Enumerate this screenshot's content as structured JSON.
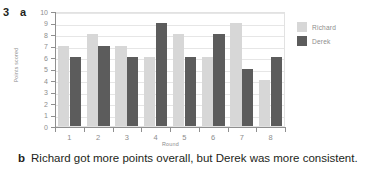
{
  "question": {
    "number": "3",
    "part_a_label": "a",
    "part_b_label": "b",
    "part_b_text": "Richard got more points overall, but Derek was more consistent."
  },
  "legend": {
    "items": [
      {
        "label": "Richard",
        "color": "#d7d7d7"
      },
      {
        "label": "Derek",
        "color": "#5c5c5c"
      }
    ]
  },
  "chart_data": {
    "type": "bar",
    "title": "",
    "xlabel": "Round",
    "ylabel": "Points scored",
    "categories": [
      "1",
      "2",
      "3",
      "4",
      "5",
      "6",
      "7",
      "8"
    ],
    "series": [
      {
        "name": "Richard",
        "color": "#d7d7d7",
        "values": [
          7,
          8,
          7,
          6,
          8,
          6,
          9,
          4
        ]
      },
      {
        "name": "Derek",
        "color": "#5c5c5c",
        "values": [
          6,
          7,
          6,
          9,
          6,
          8,
          5,
          6
        ]
      }
    ],
    "ylim": [
      0,
      10
    ],
    "yticks": [
      0,
      1,
      2,
      3,
      4,
      5,
      6,
      7,
      8,
      9,
      10
    ],
    "ytick_labels": [
      "0",
      "1",
      "2",
      "3",
      "4",
      "5",
      "6",
      "7",
      "8",
      "9",
      "10"
    ],
    "grid": true,
    "legend_position": "right"
  }
}
